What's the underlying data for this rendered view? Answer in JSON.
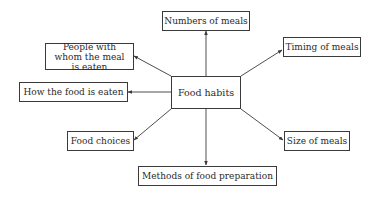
{
  "diagram": {
    "type": "mind-map",
    "center": {
      "label": "Food habits"
    },
    "nodes": [
      {
        "id": "numbers",
        "label": "Numbers of meals"
      },
      {
        "id": "timing",
        "label": "Timing of meals"
      },
      {
        "id": "people",
        "label": "People with whom the meal is eaten"
      },
      {
        "id": "how",
        "label": "How the food is eaten"
      },
      {
        "id": "choices",
        "label": "Food choices"
      },
      {
        "id": "size",
        "label": "Size of meals"
      },
      {
        "id": "methods",
        "label": "Methods of food preparation"
      }
    ],
    "edges": [
      {
        "from": "Food habits",
        "to": "Numbers of meals"
      },
      {
        "from": "Food habits",
        "to": "Timing of meals"
      },
      {
        "from": "Food habits",
        "to": "People with whom the meal is eaten"
      },
      {
        "from": "Food habits",
        "to": "How the food is eaten"
      },
      {
        "from": "Food habits",
        "to": "Food choices"
      },
      {
        "from": "Food habits",
        "to": "Size of meals"
      },
      {
        "from": "Food habits",
        "to": "Methods of food preparation"
      }
    ],
    "colors": {
      "line": "#3a3a3a",
      "text": "#2a2a2a",
      "background": "#ffffff"
    }
  }
}
